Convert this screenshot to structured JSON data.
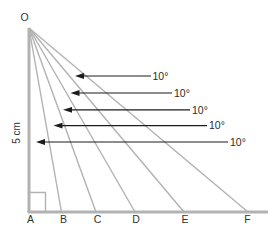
{
  "diagram": {
    "type": "geometry-angle-fan",
    "apex": {
      "label": "O"
    },
    "vertical_side": {
      "length_label": "5 cm"
    },
    "baseline": {
      "points": [
        {
          "label": "A"
        },
        {
          "label": "B"
        },
        {
          "label": "C"
        },
        {
          "label": "D"
        },
        {
          "label": "E"
        },
        {
          "label": "F"
        }
      ]
    },
    "right_angle_at": "A",
    "angle_annotations": [
      {
        "label": "10°",
        "between": "AOB"
      },
      {
        "label": "10°",
        "between": "BOC"
      },
      {
        "label": "10°",
        "between": "COD"
      },
      {
        "label": "10°",
        "between": "DOE"
      },
      {
        "label": "10°",
        "between": "EOF"
      }
    ],
    "colors": {
      "rays": "#b2b2b2",
      "arrows": "#1c1c1c",
      "text": "#333333",
      "background": "#ffffff"
    }
  }
}
